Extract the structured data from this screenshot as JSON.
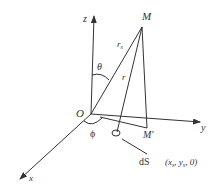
{
  "labels": {
    "z": "z",
    "y": "y",
    "x": "x",
    "origin": "O",
    "M": "M",
    "M_prime": "M'",
    "r0": "r",
    "r0_sub": "s",
    "r": "r",
    "theta": "θ",
    "phi": "ϕ",
    "dS": "dS",
    "coords": "(x",
    "coords_sub1": "s",
    "coords_mid": ", y",
    "coords_sub2": "s",
    "coords_end": ", 0)"
  },
  "colors": {
    "stroke": "#333333",
    "background": "#ffffff"
  }
}
